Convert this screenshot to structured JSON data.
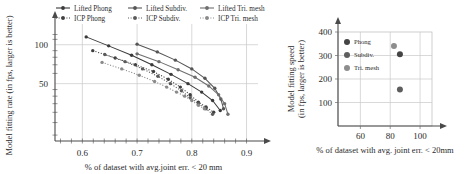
{
  "figure": {
    "panels": [
      "left-scatter-line-chart",
      "right-scatter-chart"
    ]
  },
  "chart_data": [
    {
      "id": "left",
      "type": "line",
      "title": "",
      "xlabel": "% of dataset with avg.joint err. < 20 mm",
      "ylabel": "Model fitting rate (in fps, larger is better)",
      "xlim": [
        0.55,
        0.91
      ],
      "ylim": [
        18,
        130
      ],
      "yscale": "log",
      "xticks": [
        0.6,
        0.7,
        0.8,
        0.9
      ],
      "xtick_labels": [
        "0.6",
        "0.7",
        "0.8",
        "0.9"
      ],
      "yticks": [
        50,
        100
      ],
      "ytick_labels": [
        "50",
        "100"
      ],
      "grid": true,
      "legend_position": "above",
      "series": [
        {
          "name": "Lifted Phong",
          "style": "solid",
          "color": "#3a3a3a",
          "points": [
            [
              0.607,
              115
            ],
            [
              0.648,
              98
            ],
            [
              0.69,
              83
            ],
            [
              0.727,
              70
            ],
            [
              0.762,
              59
            ],
            [
              0.793,
              50
            ],
            [
              0.818,
              43
            ],
            [
              0.838,
              37
            ],
            [
              0.852,
              31
            ]
          ]
        },
        {
          "name": "Lifted Subdiv.",
          "style": "solid",
          "color": "#555555",
          "points": [
            [
              0.7,
              101
            ],
            [
              0.737,
              88
            ],
            [
              0.77,
              76
            ],
            [
              0.8,
              65
            ],
            [
              0.824,
              55
            ],
            [
              0.842,
              46
            ],
            [
              0.853,
              38
            ],
            [
              0.858,
              32
            ]
          ]
        },
        {
          "name": "Lifted Tri. mesh",
          "style": "solid",
          "color": "#6e6e6e",
          "points": [
            [
              0.7,
              85
            ],
            [
              0.74,
              74
            ],
            [
              0.775,
              64
            ],
            [
              0.806,
              56
            ],
            [
              0.831,
              48
            ],
            [
              0.849,
              41
            ],
            [
              0.86,
              35
            ],
            [
              0.866,
              29
            ]
          ]
        },
        {
          "name": "ICP Phong",
          "style": "dotted",
          "color": "#3f3f3f",
          "points": [
            [
              0.619,
              90
            ],
            [
              0.66,
              79
            ],
            [
              0.697,
              70
            ],
            [
              0.73,
              62
            ],
            [
              0.757,
              54
            ],
            [
              0.779,
              47
            ],
            [
              0.797,
              41
            ],
            [
              0.812,
              36
            ],
            [
              0.826,
              33
            ],
            [
              0.84,
              30
            ]
          ]
        },
        {
          "name": "ICP Subdiv.",
          "style": "dotted",
          "color": "#5a5a5a",
          "points": [
            [
              0.641,
              84
            ],
            [
              0.678,
              74
            ],
            [
              0.71,
              65
            ],
            [
              0.738,
              57
            ],
            [
              0.761,
              50
            ],
            [
              0.781,
              44
            ],
            [
              0.797,
              39
            ],
            [
              0.812,
              35
            ],
            [
              0.826,
              32
            ],
            [
              0.838,
              29
            ]
          ]
        },
        {
          "name": "ICP Tri. mesh",
          "style": "dotted",
          "color": "#8a8a8a",
          "points": [
            [
              0.636,
              73
            ],
            [
              0.672,
              65
            ],
            [
              0.704,
              58
            ],
            [
              0.732,
              52
            ],
            [
              0.754,
              47
            ],
            [
              0.772,
              43
            ],
            [
              0.787,
              40
            ],
            [
              0.8,
              37
            ],
            [
              0.812,
              34
            ],
            [
              0.823,
              32
            ]
          ]
        }
      ]
    },
    {
      "id": "right",
      "type": "scatter",
      "title": "",
      "xlabel": "% of dataset with avg. joint err. < 20mm",
      "ylabel_line1": "Model fitting speed",
      "ylabel_line2": "(in fps, larger is better)",
      "xlim": [
        45,
        108
      ],
      "ylim": [
        0,
        400
      ],
      "xticks": [
        60,
        80,
        100
      ],
      "xtick_labels": [
        "60",
        "80",
        "100"
      ],
      "yticks": [
        100,
        200,
        300,
        400
      ],
      "ytick_labels": [
        "100",
        "200",
        "300",
        "400"
      ],
      "grid": true,
      "legend_position": "inside-top-left",
      "series": [
        {
          "name": "Phong",
          "color": "#444444",
          "points": [
            [
              86.5,
              305
            ]
          ]
        },
        {
          "name": "Subdiv.",
          "color": "#5e5e5e",
          "points": [
            [
              86.5,
              155
            ]
          ]
        },
        {
          "name": "Tri. mesh",
          "color": "#8d8d8d",
          "points": [
            [
              82.5,
              340
            ]
          ]
        }
      ]
    }
  ]
}
